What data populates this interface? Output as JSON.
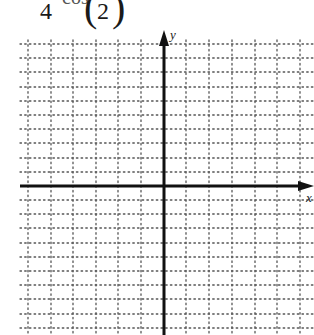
{
  "formula": {
    "fraction_denominator": "4",
    "function_name": "cos",
    "paren_open": "(",
    "argument_denominator": "2",
    "paren_close": ")"
  },
  "graph": {
    "y_axis_label": "y",
    "x_axis_label": "x",
    "grid_style": "dotted",
    "axis_color": "#111111",
    "grid_color": "#555555",
    "grid": {
      "vertical_lines_x": [
        28,
        51,
        73,
        96,
        118,
        141,
        186,
        209,
        232,
        255,
        277,
        300
      ],
      "horizontal_lines_y": [
        44,
        58,
        72,
        87,
        101,
        115,
        129,
        143,
        158,
        172,
        200,
        214,
        228,
        243,
        257,
        271,
        285,
        299,
        314,
        328
      ],
      "left": 20,
      "right": 314,
      "top": 40,
      "bottom": 335
    },
    "y_axis": {
      "x": 164,
      "top": 30,
      "bottom": 335
    },
    "x_axis": {
      "y": 186,
      "left": 20,
      "right": 312
    }
  }
}
